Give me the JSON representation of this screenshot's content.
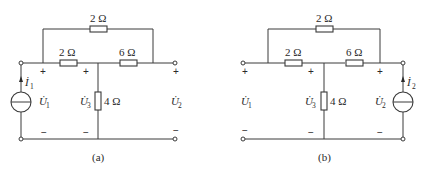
{
  "figure": {
    "circuits": [
      {
        "id": "a",
        "caption": "(a)",
        "resistors": {
          "bridge": "2 Ω",
          "left_series": "2 Ω",
          "right_series": "6 Ω",
          "shunt": "4 Ω"
        },
        "source": {
          "type": "current-source",
          "position": "left",
          "current_symbol": "İ",
          "current_sub": "1"
        },
        "voltages": [
          {
            "symbol": "U̇",
            "sub": "1",
            "plus": "+",
            "minus": "−"
          },
          {
            "symbol": "U̇",
            "sub": "3",
            "plus": "+",
            "minus": "−"
          },
          {
            "symbol": "U̇",
            "sub": "2",
            "plus": "+",
            "minus": "−"
          }
        ]
      },
      {
        "id": "b",
        "caption": "(b)",
        "resistors": {
          "bridge": "2 Ω",
          "left_series": "2 Ω",
          "right_series": "6 Ω",
          "shunt": "4 Ω"
        },
        "source": {
          "type": "current-source",
          "position": "right",
          "current_symbol": "İ",
          "current_sub": "2"
        },
        "voltages": [
          {
            "symbol": "U̇",
            "sub": "1",
            "plus": "+",
            "minus": "−"
          },
          {
            "symbol": "U̇",
            "sub": "3",
            "plus": "+",
            "minus": "−"
          },
          {
            "symbol": "U̇",
            "sub": "2",
            "plus": "+",
            "minus": "−"
          }
        ]
      }
    ]
  }
}
